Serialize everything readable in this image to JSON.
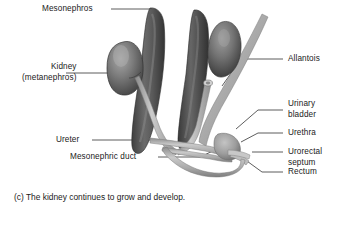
{
  "figure": {
    "caption": "(c) The kidney continues to grow and develop.",
    "background_color": "#ffffff",
    "text_color": "#1a1a1a",
    "leader_line_color": "#333333"
  },
  "labels": {
    "mesonephros": "Mesonephros",
    "kidney_line1": "Kidney",
    "kidney_line2": "(metanephros)",
    "ureter": "Ureter",
    "mesonephric_duct": "Mesonephric duct",
    "allantois": "Allantois",
    "urinary_line1": "Urinary",
    "urinary_line2": "bladder",
    "urethra": "Urethra",
    "urorectal_line1": "Urorectal",
    "urorectal_line2": "septum",
    "rectum": "Rectum"
  },
  "structures": {
    "mesonephros_color": "#5c5c5c",
    "mesonephros_shadow": "#3d3d3d",
    "kidney_color": "#6e6e6e",
    "kidney_highlight": "#9a9a9a",
    "tube_color": "#b4b4b4",
    "tube_edge": "#8a8a8a",
    "allantois_color": "#bdbdbd"
  }
}
